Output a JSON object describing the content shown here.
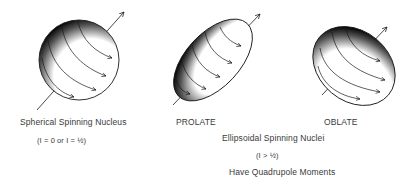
{
  "figures": [
    {
      "id": "spherical",
      "title": "Spherical Spinning Nucleus",
      "condition": "(I = 0 or I = ½)"
    },
    {
      "id": "prolate",
      "title": "PROLATE"
    },
    {
      "id": "oblate",
      "title": "OBLATE"
    }
  ],
  "group_caption": {
    "title": "Ellipsoidal Spinning Nuclei",
    "condition": "(I > ½)",
    "note": "Have Quadrupole Moments"
  },
  "colors": {
    "ink": "#1a1a1a",
    "text": "#3a3a3a",
    "background": "#ffffff"
  }
}
